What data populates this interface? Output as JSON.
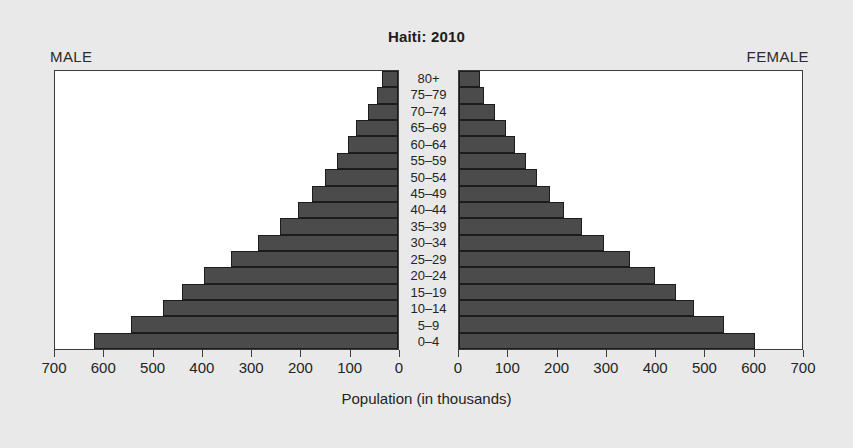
{
  "title": "Haiti: 2010",
  "labels": {
    "male": "MALE",
    "female": "FEMALE",
    "x_axis_title": "Population (in thousands)"
  },
  "colors": {
    "background": "#e9e9e9",
    "plot_background": "#ffffff",
    "bar_fill": "#4b4b4b",
    "bar_stroke": "#1c1c1c",
    "text": "#242424"
  },
  "chart_data": {
    "type": "bar",
    "subtype": "population-pyramid",
    "title": "Haiti: 2010",
    "xlabel": "Population (in thousands)",
    "ylabel": "",
    "xlim": [
      0,
      700
    ],
    "xticks": [
      0,
      100,
      200,
      300,
      400,
      500,
      600,
      700
    ],
    "left_xticks": [
      700,
      600,
      500,
      400,
      300,
      200,
      100,
      0
    ],
    "right_xticks": [
      0,
      100,
      200,
      300,
      400,
      500,
      600,
      700
    ],
    "grid": false,
    "legend": "none",
    "categories": [
      "80+",
      "75–79",
      "70–74",
      "65–69",
      "60–64",
      "55–59",
      "50–54",
      "45–49",
      "40–44",
      "35–39",
      "30–34",
      "25–29",
      "20–24",
      "15–19",
      "10–14",
      "5–9",
      "0–4"
    ],
    "series": [
      {
        "name": "MALE",
        "side": "left",
        "values": [
          33,
          42,
          62,
          85,
          103,
          125,
          150,
          175,
          205,
          240,
          285,
          340,
          395,
          440,
          480,
          545,
          620
        ]
      },
      {
        "name": "FEMALE",
        "side": "right",
        "values": [
          42,
          52,
          73,
          96,
          114,
          136,
          160,
          186,
          215,
          250,
          295,
          348,
          400,
          442,
          480,
          540,
          605
        ]
      }
    ]
  }
}
